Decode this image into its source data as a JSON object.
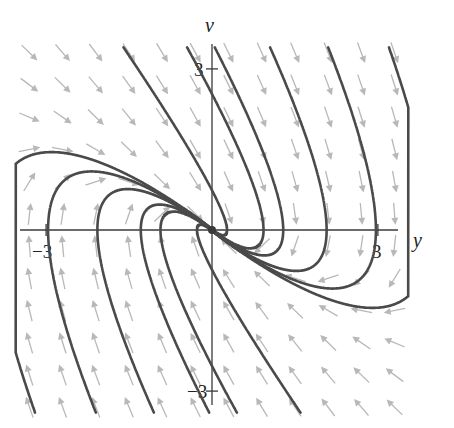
{
  "chart_data": {
    "type": "phase-portrait",
    "title": "",
    "system": {
      "dy_dt": "v",
      "dv_dt": "-y - 2v"
    },
    "xlabel": "y",
    "ylabel": "v",
    "xlim": [
      -3.5,
      3.5
    ],
    "ylim": [
      -3.5,
      3.5
    ],
    "x_ticks": [
      {
        "value": -3,
        "label": "−3"
      },
      {
        "value": 3,
        "label": "3"
      }
    ],
    "y_ticks": [
      {
        "value": 3,
        "label": "3"
      },
      {
        "value": -3,
        "label": "−3"
      }
    ],
    "grid": false,
    "legend": "none",
    "direction_field": {
      "spacing": 0.6,
      "range": [
        -3.3,
        3.3
      ]
    },
    "equilibrium": {
      "y": 0,
      "v": 0,
      "type": "degenerate-sink"
    },
    "trajectory_seeds": [
      {
        "y": -1.6,
        "v": 3.4
      },
      {
        "y": -0.45,
        "v": 3.4
      },
      {
        "y": 0.05,
        "v": 3.4
      },
      {
        "y": 1.05,
        "v": 3.4
      },
      {
        "y": 2.1,
        "v": 3.4
      },
      {
        "y": 3.2,
        "v": 3.4
      },
      {
        "y": 1.6,
        "v": -3.4
      },
      {
        "y": 0.45,
        "v": -3.4
      },
      {
        "y": -0.05,
        "v": -3.4
      },
      {
        "y": -1.05,
        "v": -3.4
      },
      {
        "y": -2.1,
        "v": -3.4
      },
      {
        "y": -3.2,
        "v": -3.4
      }
    ],
    "colors": {
      "trajectory": "#4a4a4a",
      "field": "#b8b8b8",
      "axis": "#3a3a3a"
    }
  }
}
